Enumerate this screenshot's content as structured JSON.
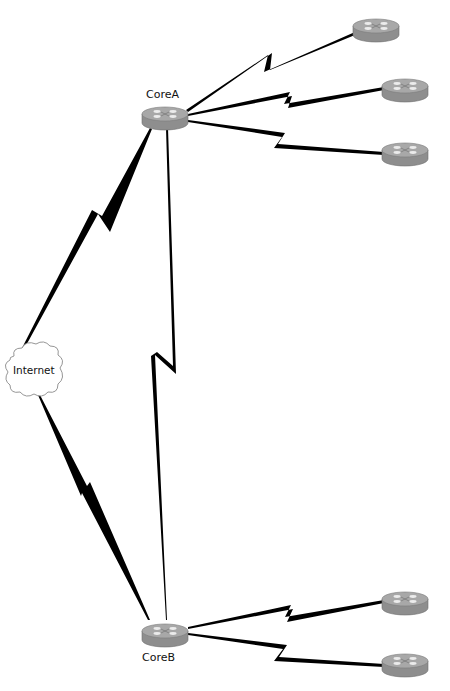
{
  "diagram": {
    "type": "network-topology",
    "colors": {
      "background": "#ffffff",
      "link": "#000000",
      "router_top": "#a6a6a6",
      "router_side": "#8c8c8c",
      "router_arrows": "#e8e8e8",
      "cloud_stroke": "#8a8a8a"
    },
    "nodes": [
      {
        "id": "CoreA",
        "label": "CoreA",
        "kind": "router",
        "cx": 165,
        "cy": 115
      },
      {
        "id": "CoreB",
        "label": "CoreB",
        "kind": "router",
        "cx": 165,
        "cy": 632
      },
      {
        "id": "Internet",
        "label": "Internet",
        "kind": "cloud",
        "cx": 33,
        "cy": 372
      },
      {
        "id": "R1",
        "label": "",
        "kind": "router",
        "cx": 376,
        "cy": 27
      },
      {
        "id": "R2",
        "label": "",
        "kind": "router",
        "cx": 405,
        "cy": 87
      },
      {
        "id": "R3",
        "label": "",
        "kind": "router",
        "cx": 405,
        "cy": 151
      },
      {
        "id": "R4",
        "label": "",
        "kind": "router",
        "cx": 405,
        "cy": 600
      },
      {
        "id": "R5",
        "label": "",
        "kind": "router",
        "cx": 405,
        "cy": 662
      }
    ],
    "links": [
      {
        "from": "CoreA",
        "to": "R1",
        "style": "serial-wan"
      },
      {
        "from": "CoreA",
        "to": "R2",
        "style": "serial-wan"
      },
      {
        "from": "CoreA",
        "to": "R3",
        "style": "serial-wan"
      },
      {
        "from": "CoreA",
        "to": "Internet",
        "style": "serial-wan"
      },
      {
        "from": "CoreA",
        "to": "CoreB",
        "style": "serial-wan"
      },
      {
        "from": "Internet",
        "to": "CoreB",
        "style": "serial-wan"
      },
      {
        "from": "CoreB",
        "to": "R4",
        "style": "serial-wan"
      },
      {
        "from": "CoreB",
        "to": "R5",
        "style": "serial-wan"
      }
    ]
  },
  "labels": {
    "coreA": "CoreA",
    "coreB": "CoreB",
    "internet": "Internet"
  }
}
